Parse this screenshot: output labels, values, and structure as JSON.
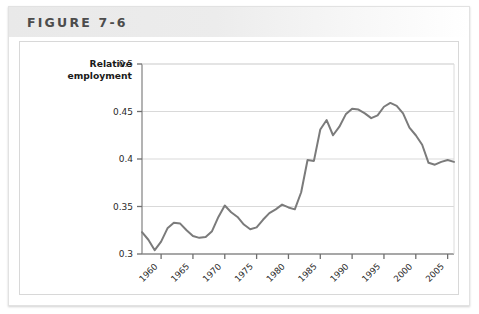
{
  "figure": {
    "title": "FIGURE 7-6",
    "card_border_color": "#e2e2e2",
    "header_band_color": "#ececec"
  },
  "chart_data": {
    "type": "line",
    "title": "",
    "subtitle": "",
    "ylabel": "Relative\nemployment",
    "ylabel_line1": "Relative",
    "ylabel_line2": "employment",
    "xlabel": "",
    "ylim": [
      0.3,
      0.5
    ],
    "xlim": [
      1957,
      2006
    ],
    "yticks": [
      0.3,
      0.35,
      0.4,
      0.45,
      0.5
    ],
    "ytick_labels": [
      "0.3",
      "0.35",
      "0.4",
      "0.45",
      "0.5"
    ],
    "xticks": [
      1960,
      1965,
      1970,
      1975,
      1980,
      1985,
      1990,
      1995,
      2000,
      2005
    ],
    "xtick_labels": [
      "1960",
      "1965",
      "1970",
      "1975",
      "1980",
      "1985",
      "1990",
      "1995",
      "2000",
      "2005"
    ],
    "xtick_rotation_deg": -45,
    "grid": "horizontal",
    "grid_color": "#d9d9d9",
    "legend": "none",
    "line_color": "#7b7b7b",
    "line_width": 2.0,
    "series": [
      {
        "name": "Relative employment",
        "x": [
          1957,
          1958,
          1959,
          1960,
          1961,
          1962,
          1963,
          1964,
          1965,
          1966,
          1967,
          1968,
          1969,
          1970,
          1971,
          1972,
          1973,
          1974,
          1975,
          1976,
          1977,
          1978,
          1979,
          1980,
          1981,
          1982,
          1983,
          1984,
          1985,
          1986,
          1987,
          1988,
          1989,
          1990,
          1991,
          1992,
          1993,
          1994,
          1995,
          1996,
          1997,
          1998,
          1999,
          2000,
          2001,
          2002,
          2003,
          2004,
          2005,
          2006
        ],
        "values": [
          0.323,
          0.315,
          0.304,
          0.313,
          0.327,
          0.333,
          0.332,
          0.325,
          0.319,
          0.317,
          0.318,
          0.324,
          0.339,
          0.351,
          0.344,
          0.339,
          0.331,
          0.326,
          0.328,
          0.336,
          0.343,
          0.347,
          0.352,
          0.349,
          0.347,
          0.365,
          0.399,
          0.398,
          0.431,
          0.441,
          0.425,
          0.434,
          0.447,
          0.453,
          0.452,
          0.448,
          0.443,
          0.446,
          0.455,
          0.459,
          0.456,
          0.448,
          0.433,
          0.425,
          0.415,
          0.396,
          0.394,
          0.397,
          0.399,
          0.397
        ]
      }
    ],
    "annotations": []
  }
}
